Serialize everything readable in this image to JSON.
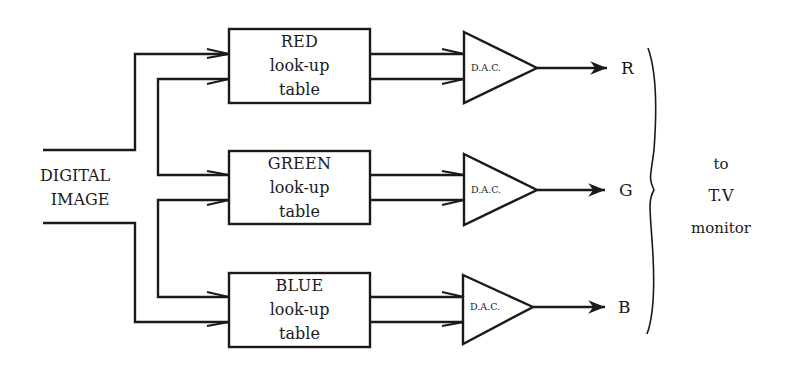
{
  "input": {
    "line1": "DIGITAL",
    "line2": "IMAGE"
  },
  "tables": [
    {
      "name": "RED",
      "line2": "look-up",
      "line3": "table"
    },
    {
      "name": "GREEN",
      "line2": "look-up",
      "line3": "table"
    },
    {
      "name": "BLUE",
      "line2": "look-up",
      "line3": "table"
    }
  ],
  "dacs": [
    {
      "label": "D.A.C."
    },
    {
      "label": "D.A.C."
    },
    {
      "label": "D.A.C."
    }
  ],
  "outputs": [
    {
      "label": "R"
    },
    {
      "label": "G"
    },
    {
      "label": "B"
    }
  ],
  "destination": {
    "line1": "to",
    "line2": "T.V",
    "line3": "monitor"
  },
  "colors": {
    "ink": "#1a1a1a",
    "background": "#ffffff"
  }
}
